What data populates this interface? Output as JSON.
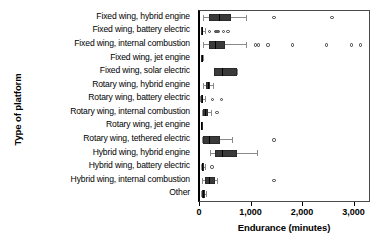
{
  "chart_data": {
    "type": "box",
    "title": "",
    "xlabel": "Endurance (minutes)",
    "ylabel": "Type of platform",
    "xlim": [
      0,
      3300
    ],
    "xticks": [
      0,
      1000,
      2000,
      3000
    ],
    "xtick_labels": [
      "0",
      "1,000",
      "2,000",
      "3,000"
    ],
    "grid": false,
    "legend": "none",
    "orientation": "horizontal",
    "categories": [
      "Fixed wing, hybrid engine",
      "Fixed wing, battery electric",
      "Fixed wing, internal combustion",
      "Fixed wing, jet engine",
      "Fixed wing, solar electric",
      "Rotary wing, hybrid engine",
      "Rotary wing, battery electric",
      "Rotary wing, internal combustion",
      "Rotary wing, jet engine",
      "Rotary wing, tethered electric",
      "Hybrid wing, hybrid engine",
      "Hybrid wing, battery electric",
      "Hybrid wing, internal combustion",
      "Other"
    ],
    "boxes": [
      {
        "category": "Fixed wing, hybrid engine",
        "whisker_low": 60,
        "q1": 180,
        "median": 360,
        "q3": 600,
        "whisker_high": 900,
        "outliers": [
          1440,
          2560
        ]
      },
      {
        "category": "Fixed wing, battery electric",
        "whisker_low": 15,
        "q1": 25,
        "median": 40,
        "q3": 60,
        "whisker_high": 90,
        "outliers": [
          180,
          300,
          330,
          360,
          460,
          540
        ]
      },
      {
        "category": "Fixed wing, internal combustion",
        "whisker_low": 60,
        "q1": 180,
        "median": 300,
        "q3": 480,
        "whisker_high": 900,
        "outliers": [
          1080,
          1140,
          1320,
          1800,
          2460,
          2940,
          3120
        ]
      },
      {
        "category": "Fixed wing, jet engine",
        "whisker_low": 20,
        "q1": 25,
        "median": 35,
        "q3": 45,
        "whisker_high": 55,
        "outliers": []
      },
      {
        "category": "Fixed wing, solar electric",
        "whisker_low": 280,
        "q1": 280,
        "median": 420,
        "q3": 720,
        "whisker_high": 720,
        "outliers": []
      },
      {
        "category": "Rotary wing, hybrid engine",
        "whisker_low": 60,
        "q1": 120,
        "median": 150,
        "q3": 200,
        "whisker_high": 260,
        "outliers": []
      },
      {
        "category": "Rotary wing, battery electric",
        "whisker_low": 5,
        "q1": 18,
        "median": 30,
        "q3": 60,
        "whisker_high": 100,
        "outliers": [
          240,
          420
        ]
      },
      {
        "category": "Rotary wing, internal combustion",
        "whisker_low": 30,
        "q1": 60,
        "median": 100,
        "q3": 150,
        "whisker_high": 220,
        "outliers": [
          330
        ]
      },
      {
        "category": "Rotary wing, jet engine",
        "whisker_low": 10,
        "q1": 15,
        "median": 20,
        "q3": 28,
        "whisker_high": 35,
        "outliers": []
      },
      {
        "category": "Rotary wing, tethered electric",
        "whisker_low": 30,
        "q1": 60,
        "median": 180,
        "q3": 390,
        "whisker_high": 620,
        "outliers": [
          1440
        ]
      },
      {
        "category": "Hybrid wing, hybrid engine",
        "whisker_low": 200,
        "q1": 300,
        "median": 420,
        "q3": 720,
        "whisker_high": 1100,
        "outliers": []
      },
      {
        "category": "Hybrid wing, battery electric",
        "whisker_low": 20,
        "q1": 30,
        "median": 45,
        "q3": 70,
        "whisker_high": 95,
        "outliers": [
          230
        ]
      },
      {
        "category": "Hybrid wing, internal combustion",
        "whisker_low": 45,
        "q1": 90,
        "median": 180,
        "q3": 300,
        "whisker_high": 330,
        "outliers": [
          1440
        ]
      },
      {
        "category": "Other",
        "whisker_low": 20,
        "q1": 40,
        "median": 60,
        "q3": 90,
        "whisker_high": 110,
        "outliers": []
      }
    ]
  }
}
